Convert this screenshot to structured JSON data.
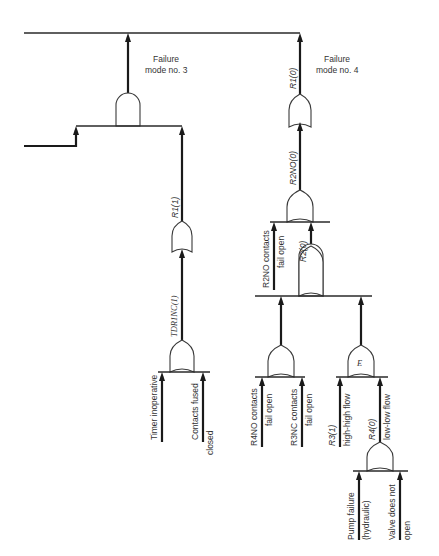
{
  "diagram": {
    "type": "fault-tree",
    "top_line": {
      "label": ""
    },
    "failure_modes": [
      {
        "id": "fm3",
        "label_line1": "Failure",
        "label_line2": "mode no. 3",
        "gate": "AND"
      },
      {
        "id": "fm4",
        "label_line1": "Failure",
        "label_line2": "mode no. 4",
        "gate": "OR"
      }
    ],
    "branch_fm3": {
      "r1_label": "R1(1)",
      "tdr_label": "TDR1NC(1)",
      "inputs": [
        {
          "line1": "Timer inoperative",
          "line2": ""
        },
        {
          "line1": "Contacts fused",
          "line2": "closed"
        }
      ]
    },
    "branch_fm4": {
      "r1_label": "R1(0)",
      "r2no_label": "R2NO(0)",
      "r2no_contacts": {
        "line1": "R2NO contacts",
        "line2": "fail open"
      },
      "r2_label": "R2(0)",
      "or_inputs": [
        {
          "line1": "R4NO contacts",
          "line2": "fail open"
        },
        {
          "line1": "R3NC contacts",
          "line2": "fail open"
        }
      ],
      "e_gate": {
        "label": "E",
        "inputs": [
          {
            "line1": "R3(1)",
            "line2": "high-high flow"
          },
          {
            "line1": "R4(0)",
            "line2": "low-low flow"
          }
        ]
      },
      "r4_inputs": [
        {
          "line1": "Pump failure",
          "line2": "(hydraulic)"
        },
        {
          "line1": "Valve does not",
          "line2": "open"
        }
      ]
    }
  }
}
